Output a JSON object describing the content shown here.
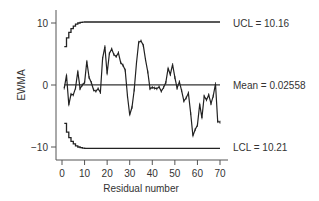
{
  "chart_data": {
    "type": "line",
    "title": "",
    "xlabel": "Residual number",
    "ylabel": "EWMA",
    "xlim": [
      0,
      70
    ],
    "ylim": [
      -12,
      12
    ],
    "x_ticks": [
      0,
      10,
      20,
      30,
      40,
      50,
      60,
      70
    ],
    "y_ticks": [
      10,
      0,
      -10
    ],
    "grid": false,
    "legend": null,
    "annotations": {
      "ucl": "UCL = 10.16",
      "mean": "Mean = 0.02558",
      "lcl": "LCL = 10.21"
    },
    "center_line": 0.02558,
    "limits_steady": {
      "ucl": 10.16,
      "lcl": -10.21
    },
    "series": [
      {
        "name": "EWMA",
        "x": [
          1,
          2,
          3,
          4,
          5,
          6,
          7,
          8,
          9,
          10,
          11,
          12,
          13,
          14,
          15,
          16,
          17,
          18,
          19,
          20,
          21,
          22,
          23,
          24,
          25,
          26,
          27,
          28,
          29,
          30,
          31,
          32,
          33,
          34,
          35,
          36,
          37,
          38,
          39,
          40,
          41,
          42,
          43,
          44,
          45,
          46,
          47,
          48,
          49,
          50,
          51,
          52,
          53,
          54,
          55,
          56,
          57,
          58,
          59,
          60,
          61,
          62,
          63,
          64,
          65,
          66,
          67,
          68,
          69,
          70
        ],
        "values": [
          -0.5,
          1.6,
          -3.2,
          -1.5,
          -1.6,
          -0.5,
          2.2,
          -0.6,
          0,
          0.4,
          3.8,
          1.2,
          0.4,
          -0.8,
          -1.0,
          -0.6,
          -1.2,
          4.3,
          6.2,
          1.8,
          5.1,
          5.8,
          4.9,
          4.6,
          5.2,
          3.6,
          3.2,
          2.4,
          -1.8,
          -4.8,
          -3.6,
          -0.8,
          3.6,
          6.9,
          7.1,
          6.4,
          4.1,
          2.1,
          -0.6,
          -0.4,
          -0.5,
          -0.6,
          -0.3,
          -1.0,
          -0.4,
          0.4,
          2.7,
          1.7,
          3.3,
          1.2,
          -0.5,
          0.5,
          -0.9,
          -2.6,
          -2.1,
          -1.3,
          -4.6,
          -8.2,
          -7.2,
          -6.5,
          -3.1,
          -5.3,
          -1.8,
          -2.4,
          -1.6,
          -3.0,
          -1.8,
          0.2,
          -5.9,
          -6.0
        ]
      },
      {
        "name": "UCL",
        "x": [
          1,
          2,
          3,
          4,
          5,
          6,
          7,
          8,
          9,
          10,
          70
        ],
        "values": [
          6.2,
          7.6,
          8.5,
          9.1,
          9.5,
          9.8,
          10.0,
          10.1,
          10.15,
          10.16,
          10.16
        ]
      },
      {
        "name": "LCL",
        "x": [
          1,
          2,
          3,
          4,
          5,
          6,
          7,
          8,
          9,
          10,
          70
        ],
        "values": [
          -6.2,
          -7.6,
          -8.5,
          -9.1,
          -9.5,
          -9.8,
          -10.0,
          -10.1,
          -10.17,
          -10.21,
          -10.21
        ]
      }
    ]
  }
}
